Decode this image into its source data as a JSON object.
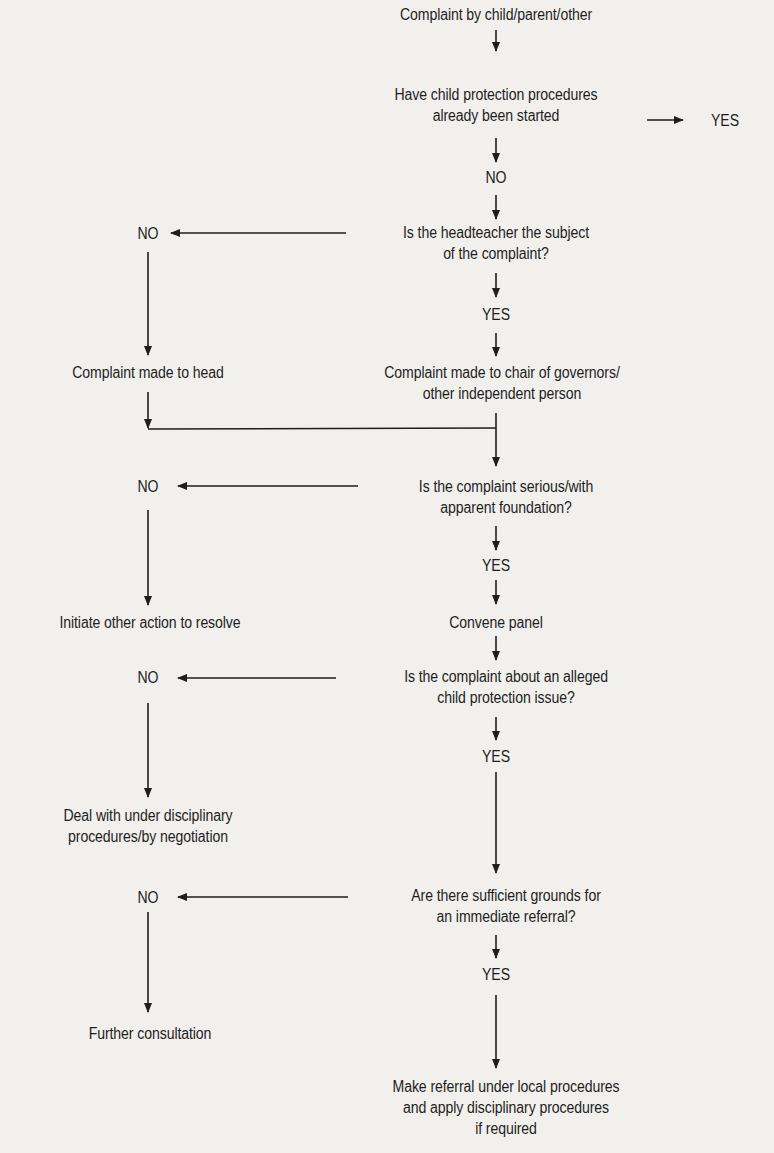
{
  "diagram": {
    "type": "flowchart",
    "colors": {
      "background": "#f1f0ed",
      "ink": "#1e1e1e"
    },
    "nodes": {
      "start": {
        "lines": [
          "Complaint by child/parent/other"
        ]
      },
      "q_cp_started": {
        "lines": [
          "Have child protection procedures",
          "already been started"
        ]
      },
      "q_cp_started_yes": {
        "lines": [
          "YES"
        ]
      },
      "q_cp_started_no": {
        "lines": [
          "NO"
        ]
      },
      "q_head_subject": {
        "lines": [
          "Is the headteacher the subject",
          "of the complaint?"
        ]
      },
      "q_head_subject_no": {
        "lines": [
          "NO"
        ]
      },
      "q_head_subject_yes": {
        "lines": [
          "YES"
        ]
      },
      "to_head": {
        "lines": [
          "Complaint made to head"
        ]
      },
      "to_chair": {
        "lines": [
          "Complaint made to chair of governors/",
          "other independent person"
        ]
      },
      "q_serious": {
        "lines": [
          "Is the complaint serious/with",
          "apparent foundation?"
        ]
      },
      "q_serious_no": {
        "lines": [
          "NO"
        ]
      },
      "q_serious_yes": {
        "lines": [
          "YES"
        ]
      },
      "other_action": {
        "lines": [
          "Initiate other action to resolve"
        ]
      },
      "convene_panel": {
        "lines": [
          "Convene panel"
        ]
      },
      "q_cp_issue": {
        "lines": [
          "Is the complaint about an alleged",
          "child protection issue?"
        ]
      },
      "q_cp_issue_no": {
        "lines": [
          "NO"
        ]
      },
      "q_cp_issue_yes": {
        "lines": [
          "YES"
        ]
      },
      "disciplinary": {
        "lines": [
          "Deal with under disciplinary",
          "procedures/by negotiation"
        ]
      },
      "q_grounds": {
        "lines": [
          "Are there sufficient grounds for",
          "an immediate referral?"
        ]
      },
      "q_grounds_no": {
        "lines": [
          "NO"
        ]
      },
      "q_grounds_yes": {
        "lines": [
          "YES"
        ]
      },
      "further_consult": {
        "lines": [
          "Further consultation"
        ]
      },
      "make_referral": {
        "lines": [
          "Make referral under local procedures",
          "and apply disciplinary procedures",
          "if required"
        ]
      }
    },
    "edges": [
      [
        "start",
        "q_cp_started"
      ],
      [
        "q_cp_started",
        "q_cp_started_yes"
      ],
      [
        "q_cp_started",
        "q_cp_started_no"
      ],
      [
        "q_cp_started_no",
        "q_head_subject"
      ],
      [
        "q_head_subject",
        "q_head_subject_no"
      ],
      [
        "q_head_subject",
        "q_head_subject_yes"
      ],
      [
        "q_head_subject_no",
        "to_head"
      ],
      [
        "q_head_subject_yes",
        "to_chair"
      ],
      [
        "to_head",
        "q_serious"
      ],
      [
        "to_chair",
        "q_serious"
      ],
      [
        "q_serious",
        "q_serious_no"
      ],
      [
        "q_serious",
        "q_serious_yes"
      ],
      [
        "q_serious_no",
        "other_action"
      ],
      [
        "q_serious_yes",
        "convene_panel"
      ],
      [
        "convene_panel",
        "q_cp_issue"
      ],
      [
        "q_cp_issue",
        "q_cp_issue_no"
      ],
      [
        "q_cp_issue",
        "q_cp_issue_yes"
      ],
      [
        "q_cp_issue_no",
        "disciplinary"
      ],
      [
        "q_cp_issue_yes",
        "q_grounds"
      ],
      [
        "q_grounds",
        "q_grounds_no"
      ],
      [
        "q_grounds",
        "q_grounds_yes"
      ],
      [
        "q_grounds_no",
        "further_consult"
      ],
      [
        "q_grounds_yes",
        "make_referral"
      ]
    ]
  }
}
